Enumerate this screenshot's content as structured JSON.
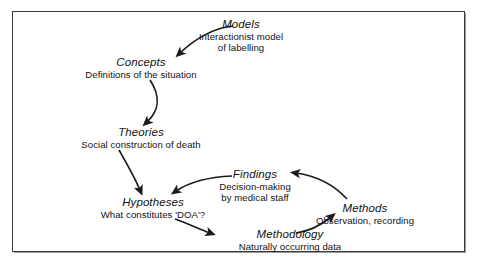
{
  "diagram": {
    "type": "cycle-flow",
    "background_color": "#ffffff",
    "line_color": "#1a1a1a",
    "frame_color": "#3a3a3a",
    "nodes": [
      {
        "id": "models",
        "title": "Models",
        "subtitle": "Interactionist model\nof labelling"
      },
      {
        "id": "concepts",
        "title": "Concepts",
        "subtitle": "Definitions of the situation"
      },
      {
        "id": "theories",
        "title": "Theories",
        "subtitle": "Social construction of death"
      },
      {
        "id": "hypotheses",
        "title": "Hypotheses",
        "subtitle": "What constitutes 'DOA'?"
      },
      {
        "id": "findings",
        "title": "Findings",
        "subtitle": "Decision-making\nby medical staff"
      },
      {
        "id": "methods",
        "title": "Methods",
        "subtitle": "Observation, recording"
      },
      {
        "id": "methodology",
        "title": "Methodology",
        "subtitle": "Naturally occurring data"
      }
    ],
    "edges": [
      {
        "from": "models",
        "to": "concepts"
      },
      {
        "from": "concepts",
        "to": "theories"
      },
      {
        "from": "theories",
        "to": "hypotheses"
      },
      {
        "from": "hypotheses",
        "to": "methodology"
      },
      {
        "from": "methodology",
        "to": "methods"
      },
      {
        "from": "methods",
        "to": "findings"
      },
      {
        "from": "findings",
        "to": "hypotheses"
      }
    ]
  },
  "models": {
    "title": "Models",
    "sub1": "Interactionist model",
    "sub2": "of labelling"
  },
  "concepts": {
    "title": "Concepts",
    "sub1": "Definitions of the situation"
  },
  "theories": {
    "title": "Theories",
    "sub1": "Social construction of death"
  },
  "hypotheses": {
    "title": "Hypotheses",
    "sub1": "What constitutes 'DOA'?"
  },
  "findings": {
    "title": "Findings",
    "sub1": "Decision-making",
    "sub2": "by medical staff"
  },
  "methods": {
    "title": "Methods",
    "sub1": "Observation, recording"
  },
  "methodology": {
    "title": "Methodology",
    "sub1": "Naturally occurring data"
  }
}
